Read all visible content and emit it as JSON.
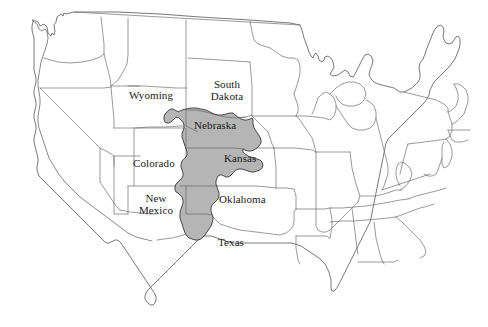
{
  "figure": {
    "kind": "us-states-map",
    "caption": "",
    "width": 488,
    "height": 327
  },
  "colors": {
    "background": "#ffffff",
    "state_border": "#6e6e6e",
    "coastline": "#555555",
    "highlight_fill": "#b5b5b5",
    "highlight_stroke": "#3a3a3a",
    "label_text": "#1a1a1a"
  },
  "highlight_region": {
    "name": "High Plains Aquifer",
    "fill": "#b5b5b5",
    "states_covered": [
      "South Dakota",
      "Wyoming",
      "Nebraska",
      "Colorado",
      "Kansas",
      "New Mexico",
      "Oklahoma",
      "Texas"
    ]
  },
  "labels": [
    {
      "id": "wyoming",
      "text": "Wyoming",
      "x": 131,
      "y": 95,
      "lines": 1
    },
    {
      "id": "south-dakota",
      "text": "South\nDakota",
      "x": 201,
      "y": 84,
      "lines": 2
    },
    {
      "id": "nebraska",
      "text": "Nebraska",
      "x": 197,
      "y": 124,
      "lines": 1
    },
    {
      "id": "colorado",
      "text": "Colorado",
      "x": 135,
      "y": 162,
      "lines": 1
    },
    {
      "id": "kansas",
      "text": "Kansas",
      "x": 225,
      "y": 157,
      "lines": 1
    },
    {
      "id": "new-mexico",
      "text": "New\nMexico",
      "x": 133,
      "y": 198,
      "lines": 2
    },
    {
      "id": "oklahoma",
      "text": "Oklahoma",
      "x": 222,
      "y": 198,
      "lines": 1
    },
    {
      "id": "texas",
      "text": "Texas",
      "x": 220,
      "y": 240,
      "lines": 1
    }
  ],
  "label_text": {
    "wyoming": "Wyoming",
    "south_dakota_line1": "South",
    "south_dakota_line2": "Dakota",
    "nebraska": "Nebraska",
    "colorado": "Colorado",
    "kansas": "Kansas",
    "new_mexico_line1": "New",
    "new_mexico_line2": "Mexico",
    "oklahoma": "Oklahoma",
    "texas": "Texas"
  }
}
